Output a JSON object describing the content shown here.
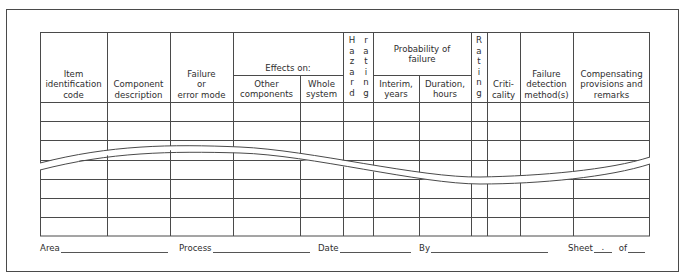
{
  "form": {
    "headers": {
      "item_code": "Item identification code",
      "component": "Component description",
      "failure_mode": "Failure or error mode",
      "effects_on": "Effects on:",
      "other_components": "Other components",
      "whole_system": "Whole system",
      "hazard_left": [
        "H",
        "a",
        "z",
        "a",
        "r",
        "d"
      ],
      "hazard_right": [
        "r",
        "a",
        "t",
        "i",
        "n",
        "g"
      ],
      "probability": "Probability of failure",
      "interim": "Interim, years",
      "duration": "Duration, hours",
      "rating": [
        "R",
        "a",
        "t",
        "i",
        "n",
        "g"
      ],
      "criticality": "Criti- cality",
      "detection": "Failure detection method(s)",
      "compensating": "Compensating provisions and remarks"
    },
    "header_lines": {
      "item_code": [
        "Item",
        "identification",
        "code"
      ],
      "component": [
        "Component",
        "description"
      ],
      "failure_mode": [
        "Failure",
        "or",
        "error mode"
      ],
      "other_components": [
        "Other",
        "components"
      ],
      "whole_system": [
        "Whole",
        "system"
      ],
      "probability": [
        "Probability of",
        "failure"
      ],
      "interim": [
        "Interim,",
        "years"
      ],
      "duration": [
        "Duration,",
        "hours"
      ],
      "criticality": [
        "Criti-",
        "cality"
      ],
      "detection": [
        "Failure",
        "detection",
        "method(s)"
      ],
      "compensating": [
        "Compensating",
        "provisions and",
        "remarks"
      ]
    },
    "rows_visible": 7,
    "break_indicator": "wavy-break"
  },
  "footer": {
    "area_label": "Area",
    "process_label": "Process",
    "date_label": "Date",
    "by_label": "By",
    "sheet_label": "Sheet",
    "sheet_value": ".",
    "of_label": "of"
  }
}
